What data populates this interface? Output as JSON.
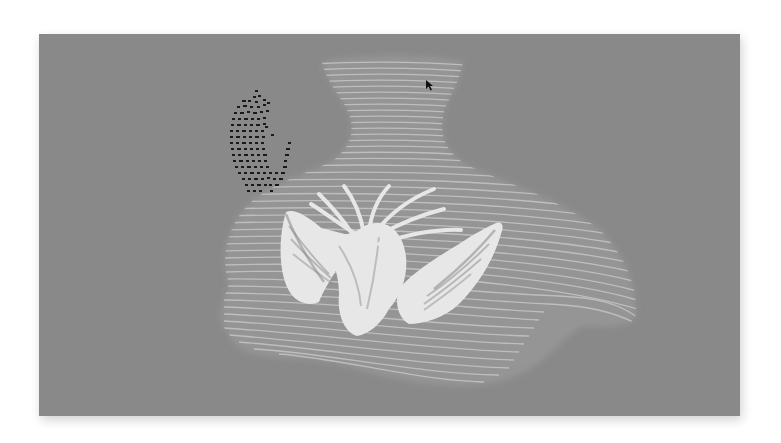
{
  "scene": {
    "description": "Gray-toned image of a translucent layered vase-shaped sculpture with horizontal contour lines, white bird-wing forms in the center, and a cluster of black dots at upper left",
    "colors": {
      "page_background": "#ffffff",
      "panel_background": "#8a8a8a",
      "vase_fill": "#959595",
      "contour_lines": "#c8c8c8",
      "wings": "#ececec",
      "dots": "#151515",
      "cursor": "#111111"
    },
    "elements": {
      "vase": "vase-shaped contour sculpture",
      "wings": "white bird wings",
      "dot_cluster": "black dot pattern",
      "cursor": "mouse pointer"
    }
  }
}
